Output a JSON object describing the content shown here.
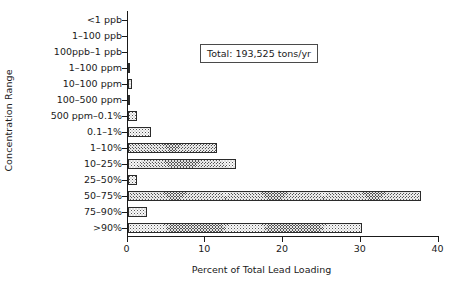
{
  "chart_data": {
    "type": "bar",
    "orientation": "horizontal",
    "title": "",
    "xlabel": "Percent of Total Lead Loading",
    "ylabel": "Concentration Range",
    "xlim": [
      0,
      40
    ],
    "xticks": [
      0,
      10,
      20,
      30,
      40
    ],
    "xtick_labels": [
      "0",
      "10",
      "20",
      "30",
      "40"
    ],
    "grid": false,
    "legend": null,
    "annotations": [
      {
        "name": "total-annotation",
        "text": "Total: 193,525 tons/yr",
        "boxed": true
      }
    ],
    "categories": [
      "<1 ppb",
      "1–100 ppb",
      "100ppb–1 ppb",
      "1–100 ppm",
      "10–100 ppm",
      "100–500 ppm",
      "500 ppm–0.1%",
      "0.1–1%",
      "1–10%",
      "10–25%",
      "25–50%",
      "50–75%",
      "75–90%",
      ">90%"
    ],
    "values": [
      0,
      0,
      0,
      0.25,
      0.5,
      0.2,
      1.2,
      3.0,
      11.5,
      13.9,
      1.2,
      37.7,
      2.4,
      30.1
    ],
    "series_name": "Percent of Total Lead Loading",
    "bar_color": "#555555",
    "bar_pattern": "crosshatch",
    "bar_edge_color": "#2b2b2b",
    "axis_color": "#1a1a1a",
    "background_color": "#ffffff"
  }
}
